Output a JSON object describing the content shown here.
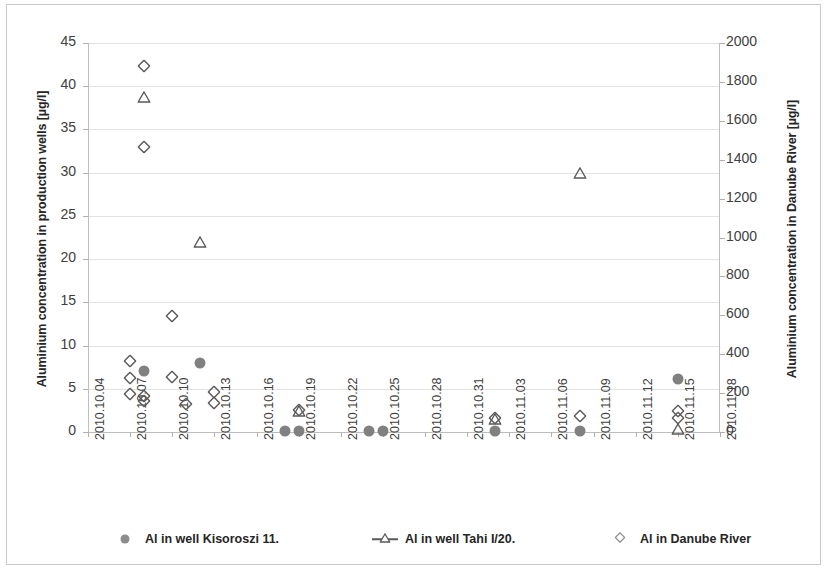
{
  "chart_data": {
    "type": "scatter",
    "title": "",
    "xlabel": "",
    "ylabel": "Aluminium concentration in production wells [µg/l]",
    "ylabel_right": "Aluminium concentration in Danube River [µg/l]",
    "xtick_labels": [
      "2010.10.04",
      "2010.10.07",
      "2010.10.10",
      "2010.10.13",
      "2010.10.16",
      "2010.10.19",
      "2010.10.22",
      "2010.10.25",
      "2010.10.28",
      "2010.10.31",
      "2010.11.03",
      "2010.11.06",
      "2010.11.09",
      "2010.11.12",
      "2010.11.15",
      "2010.11.18"
    ],
    "xlim": [
      "2010.10.04",
      "2010.11.18"
    ],
    "ytick_labels_left": [
      "0",
      "5",
      "10",
      "15",
      "20",
      "25",
      "30",
      "35",
      "40",
      "45"
    ],
    "ytick_values_left": [
      0,
      5,
      10,
      15,
      20,
      25,
      30,
      35,
      40,
      45
    ],
    "ylim_left": [
      0,
      45
    ],
    "ytick_labels_right": [
      "0",
      "200",
      "400",
      "600",
      "800",
      "1000",
      "1200",
      "1400",
      "1600",
      "1800",
      "2000"
    ],
    "ytick_values_right": [
      0,
      200,
      400,
      600,
      800,
      1000,
      1200,
      1400,
      1600,
      1800,
      2000
    ],
    "ylim_right": [
      0,
      2000
    ],
    "grid": true,
    "legend_position": "bottom",
    "series": [
      {
        "name": "Al in well Kisoroszi 11.",
        "marker": "filled-circle",
        "color": "#808080",
        "axis": "left",
        "points": [
          {
            "x": "2010.10.08",
            "y": 7.0
          },
          {
            "x": "2010.10.12",
            "y": 8.0
          },
          {
            "x": "2010.10.18",
            "y": 0.1
          },
          {
            "x": "2010.10.19",
            "y": 0.1
          },
          {
            "x": "2010.10.24",
            "y": 0.1
          },
          {
            "x": "2010.10.25",
            "y": 0.1
          },
          {
            "x": "2010.11.02",
            "y": 0.1
          },
          {
            "x": "2010.11.08",
            "y": 0.1
          },
          {
            "x": "2010.11.15",
            "y": 6.1
          }
        ]
      },
      {
        "name": "Al in well Tahi I/20.",
        "marker": "open-triangle",
        "color": "#595959",
        "axis": "left",
        "points": [
          {
            "x": "2010.10.08",
            "y": 38.8
          },
          {
            "x": "2010.10.12",
            "y": 22.0
          },
          {
            "x": "2010.10.19",
            "y": 2.4
          },
          {
            "x": "2010.11.02",
            "y": 1.5
          },
          {
            "x": "2010.11.08",
            "y": 30.0
          },
          {
            "x": "2010.11.15",
            "y": 0.3
          }
        ]
      },
      {
        "name": "Al in Danube River",
        "marker": "open-diamond",
        "color": "#595959",
        "axis": "right",
        "points": [
          {
            "x": "2010.10.07",
            "y": 8.2,
            "right_value": 364
          },
          {
            "x": "2010.10.07",
            "y": 6.3,
            "right_value": 280
          },
          {
            "x": "2010.10.07",
            "y": 4.4,
            "right_value": 196
          },
          {
            "x": "2010.10.08",
            "y": 42.3,
            "right_value": 1880
          },
          {
            "x": "2010.10.08",
            "y": 33.0,
            "right_value": 1467
          },
          {
            "x": "2010.10.08",
            "y": 4.2,
            "right_value": 187
          },
          {
            "x": "2010.10.08",
            "y": 3.6,
            "right_value": 160
          },
          {
            "x": "2010.10.10",
            "y": 13.4,
            "right_value": 596
          },
          {
            "x": "2010.10.10",
            "y": 6.4,
            "right_value": 284
          },
          {
            "x": "2010.10.11",
            "y": 3.2,
            "right_value": 142
          },
          {
            "x": "2010.10.13",
            "y": 4.6,
            "right_value": 204
          },
          {
            "x": "2010.10.13",
            "y": 3.4,
            "right_value": 151
          },
          {
            "x": "2010.10.19",
            "y": 2.6,
            "right_value": 116
          },
          {
            "x": "2010.11.02",
            "y": 1.6,
            "right_value": 71
          },
          {
            "x": "2010.11.08",
            "y": 1.8,
            "right_value": 80
          },
          {
            "x": "2010.11.15",
            "y": 2.4,
            "right_value": 107
          },
          {
            "x": "2010.11.15",
            "y": 1.6,
            "right_value": 71
          }
        ]
      }
    ]
  },
  "legend": {
    "items": [
      {
        "label": "Al in well Kisoroszi 11.",
        "marker": "filled-circle"
      },
      {
        "label": "Al in well Tahi I/20.",
        "marker": "line-open-triangle"
      },
      {
        "label": "Al in Danube River",
        "marker": "open-diamond"
      }
    ]
  }
}
